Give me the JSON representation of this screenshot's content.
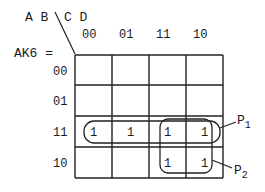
{
  "kmap": {
    "row_vars": "A B",
    "col_vars": "C D",
    "function_name": "AK6 =",
    "col_headers": [
      "00",
      "01",
      "11",
      "10"
    ],
    "row_headers": [
      "00",
      "01",
      "11",
      "10"
    ],
    "cells": [
      [
        "",
        "",
        "",
        ""
      ],
      [
        "",
        "",
        "",
        ""
      ],
      [
        "1",
        "1",
        "1",
        "1"
      ],
      [
        "",
        "",
        "1",
        "1"
      ]
    ],
    "groups": [
      {
        "label_main": "P",
        "label_sub": "1",
        "description": "row 11, all columns"
      },
      {
        "label_main": "P",
        "label_sub": "2",
        "description": "rows 11-10, columns 11-10"
      }
    ]
  }
}
